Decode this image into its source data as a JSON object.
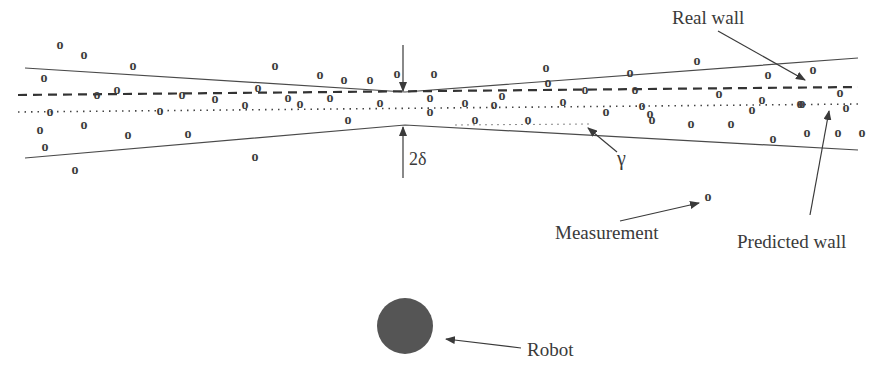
{
  "labels": {
    "real_wall": "Real wall",
    "predicted_wall": "Predicted wall",
    "measurement": "Measurement",
    "robot": "Robot",
    "two_delta": "2δ",
    "gamma": "γ"
  },
  "measurement_glyph": "o",
  "colors": {
    "ink": "#3a3a3a",
    "robot_fill": "#555555",
    "background": "#ffffff"
  },
  "measurements": [
    [
      60,
      45
    ],
    [
      84,
      55
    ],
    [
      133,
      66
    ],
    [
      275,
      66
    ],
    [
      320,
      75
    ],
    [
      344,
      80
    ],
    [
      370,
      80
    ],
    [
      397,
      74
    ],
    [
      434,
      74
    ],
    [
      546,
      68
    ],
    [
      630,
      73
    ],
    [
      697,
      61
    ],
    [
      768,
      75
    ],
    [
      813,
      70
    ],
    [
      44,
      78
    ],
    [
      97,
      95
    ],
    [
      117,
      90
    ],
    [
      182,
      95
    ],
    [
      215,
      99
    ],
    [
      258,
      88
    ],
    [
      288,
      98
    ],
    [
      330,
      98
    ],
    [
      380,
      103
    ],
    [
      430,
      98
    ],
    [
      465,
      103
    ],
    [
      502,
      96
    ],
    [
      548,
      83
    ],
    [
      585,
      90
    ],
    [
      635,
      90
    ],
    [
      719,
      94
    ],
    [
      762,
      100
    ],
    [
      802,
      104
    ],
    [
      840,
      93
    ],
    [
      50,
      112
    ],
    [
      160,
      111
    ],
    [
      245,
      105
    ],
    [
      300,
      104
    ],
    [
      430,
      112
    ],
    [
      494,
      105
    ],
    [
      563,
      102
    ],
    [
      606,
      112
    ],
    [
      642,
      106
    ],
    [
      650,
      114
    ],
    [
      752,
      110
    ],
    [
      800,
      104
    ],
    [
      846,
      108
    ],
    [
      40,
      130
    ],
    [
      84,
      125
    ],
    [
      128,
      135
    ],
    [
      188,
      134
    ],
    [
      348,
      120
    ],
    [
      475,
      120
    ],
    [
      528,
      120
    ],
    [
      652,
      120
    ],
    [
      691,
      124
    ],
    [
      731,
      124
    ],
    [
      773,
      139
    ],
    [
      807,
      133
    ],
    [
      838,
      133
    ],
    [
      862,
      133
    ],
    [
      45,
      147
    ],
    [
      75,
      170
    ],
    [
      255,
      157
    ],
    [
      708,
      197
    ]
  ]
}
